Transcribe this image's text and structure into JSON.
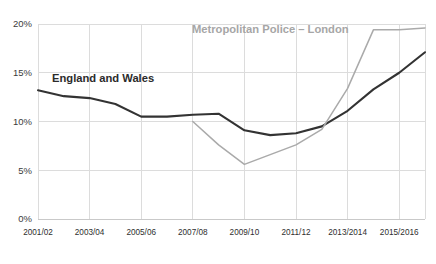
{
  "chart_data": {
    "type": "line",
    "title": "",
    "subtitle": "",
    "xlabel": "",
    "ylabel": "",
    "grid": true,
    "legend_position": "inline-annotation",
    "ylim": [
      0,
      20
    ],
    "ytick_labels": [
      "0%",
      "5%",
      "10%",
      "15%",
      "20%"
    ],
    "ytick_values": [
      0,
      5,
      10,
      15,
      20
    ],
    "x": [
      "2001/02",
      "2002/03",
      "2003/04",
      "2004/05",
      "2005/06",
      "2006/07",
      "2007/08",
      "2008/09",
      "2009/10",
      "2010/11",
      "2011/12",
      "2012/13",
      "2013/2014",
      "2014/2015",
      "2015/2016",
      "2016/2017"
    ],
    "xtick_labels": [
      "2001/02",
      "2003/04",
      "2005/06",
      "2007/08",
      "2009/10",
      "2011/12",
      "2013/2014",
      "2015/2016"
    ],
    "xtick_indices": [
      0,
      2,
      4,
      6,
      8,
      10,
      12,
      14
    ],
    "series": [
      {
        "name": "England and Wales",
        "color": "#333333",
        "label_color": "#2b2b2b",
        "label_x": 52,
        "label_y": 82,
        "values": [
          13.2,
          12.6,
          12.4,
          11.8,
          10.5,
          10.5,
          10.7,
          10.8,
          9.1,
          8.6,
          8.8,
          9.5,
          11.1,
          13.3,
          15.0,
          17.1
        ]
      },
      {
        "name": "Metropolitan Police – London",
        "color": "#aaaaaa",
        "label_color": "#a6a6a6",
        "label_x": 192,
        "label_y": 33,
        "values": [
          null,
          null,
          null,
          null,
          null,
          null,
          10.0,
          7.6,
          5.6,
          6.6,
          7.6,
          9.2,
          13.4,
          19.4,
          19.4,
          19.6
        ]
      }
    ]
  },
  "layout": {
    "plot_left": 38,
    "plot_right": 425,
    "plot_top": 24,
    "plot_bottom": 219
  }
}
